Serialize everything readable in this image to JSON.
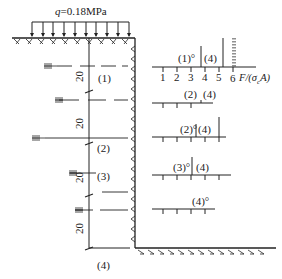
{
  "load": {
    "label": "q=0.18MPa",
    "q_symbol": "q",
    "q_value": "=0.18MPa"
  },
  "stages": [
    {
      "id": "1",
      "label": "(1)"
    },
    {
      "id": "2",
      "label": "(2)"
    },
    {
      "id": "3",
      "label": "(3)"
    },
    {
      "id": "4",
      "label": "(4)"
    }
  ],
  "dimensions": [
    "20",
    "20",
    "20",
    "20"
  ],
  "scale": {
    "ticks": [
      "1",
      "2",
      "3",
      "4",
      "5",
      "6"
    ],
    "axis_label": "F/(σ_cA)",
    "axis_label_display": "F/(σ",
    "axis_label_sub": "c",
    "axis_label_tail": "A)"
  },
  "bars": [
    {
      "left_label": "(1)°",
      "right_label": "(4)"
    },
    {
      "left_label": "(2)",
      "right_label": "(4)"
    },
    {
      "left_label": "(2)°",
      "right_label": "(4)"
    },
    {
      "left_label": "(3)°",
      "right_label": "(4)"
    },
    {
      "left_label": "(4)°",
      "right_label": ""
    }
  ],
  "colors": {
    "ink": "#222222",
    "background": "#ffffff"
  }
}
